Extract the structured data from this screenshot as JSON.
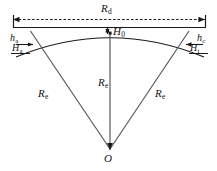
{
  "figure": {
    "background_color": "#ffffff",
    "line_color": "#1a1a1a",
    "width": 217,
    "height": 171
  },
  "labels": {
    "chord_span": {
      "symbol": "R",
      "subscript": "d"
    },
    "apex_height": {
      "symbol": "H",
      "subscript": "0"
    },
    "left_small_height": {
      "symbol": "h",
      "subscript": "a"
    },
    "left_cap_height": {
      "symbol": "H",
      "subscript": "a"
    },
    "right_small_height": {
      "symbol": "h",
      "subscript": "c"
    },
    "right_cap_height": {
      "symbol": "H",
      "subscript": "t"
    },
    "radius_left": {
      "symbol": "R",
      "subscript": "e"
    },
    "radius_center": {
      "symbol": "R",
      "subscript": "e"
    },
    "radius_right": {
      "symbol": "R",
      "subscript": "e"
    },
    "center_point": {
      "symbol": "O",
      "subscript": ""
    }
  },
  "geometry": {
    "center_o": {
      "x": 110,
      "y": 150
    },
    "apex": {
      "x": 110,
      "y": 33
    },
    "chord_left": {
      "x": 13,
      "y": 27
    },
    "chord_right": {
      "x": 206,
      "y": 27
    },
    "dimension_line_y": 19,
    "arc_left": {
      "x": 22,
      "y": 50
    },
    "arc_right": {
      "x": 197,
      "y": 50
    },
    "radius_left_cross": {
      "x": 50,
      "y": 45
    },
    "radius_right_cross": {
      "x": 170,
      "y": 45
    }
  }
}
